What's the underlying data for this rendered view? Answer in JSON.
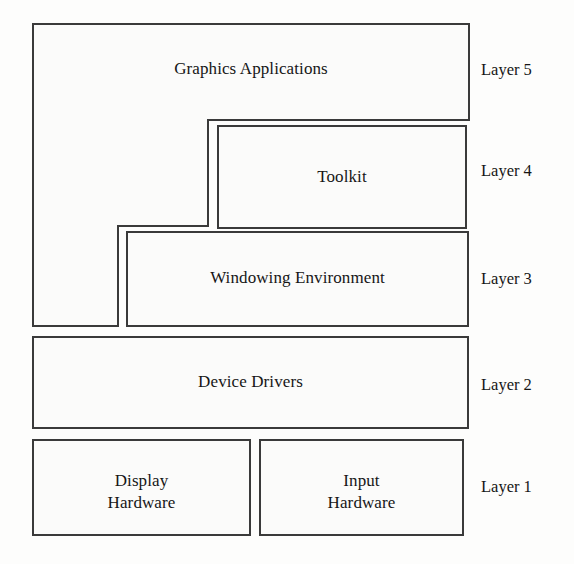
{
  "diagram": {
    "background_color": "#fdfdfc",
    "box_fill_color": "#fbfbfa",
    "box_stroke_color": "#3a3a3a",
    "text_color": "#161616",
    "boxes": [
      {
        "id": "graphics-applications",
        "label": "Graphics Applications",
        "layer": "Layer 5",
        "shape": "stepped-polygon"
      },
      {
        "id": "toolkit",
        "label": "Toolkit",
        "layer": "Layer 4",
        "shape": "rectangle"
      },
      {
        "id": "windowing-environment",
        "label": "Windowing Environment",
        "layer": "Layer 3",
        "shape": "rectangle"
      },
      {
        "id": "device-drivers",
        "label": "Device Drivers",
        "layer": "Layer 2",
        "shape": "rectangle"
      },
      {
        "id": "display-hardware",
        "label": "Display\nHardware",
        "layer": "Layer 1",
        "shape": "rectangle"
      },
      {
        "id": "input-hardware",
        "label": "Input\nHardware",
        "layer": "Layer 1",
        "shape": "rectangle"
      }
    ],
    "layer_tags": [
      {
        "id": "layer-5",
        "label": "Layer 5"
      },
      {
        "id": "layer-4",
        "label": "Layer 4"
      },
      {
        "id": "layer-3",
        "label": "Layer 3"
      },
      {
        "id": "layer-2",
        "label": "Layer 2"
      },
      {
        "id": "layer-1",
        "label": "Layer 1"
      }
    ]
  }
}
